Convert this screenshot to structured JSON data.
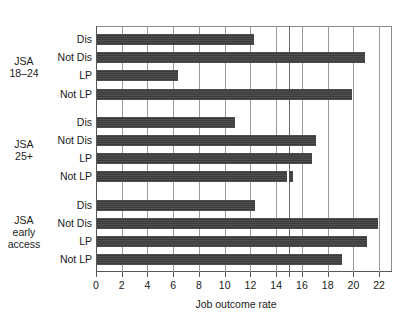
{
  "chart_data": {
    "type": "bar",
    "orientation": "horizontal",
    "title": "",
    "xlabel": "Job outcome rate",
    "ylabel": "",
    "xlim": [
      0,
      23
    ],
    "ylim": null,
    "grid": true,
    "legend": null,
    "xticks": [
      0,
      2,
      4,
      6,
      8,
      10,
      12,
      14,
      16,
      18,
      20,
      22
    ],
    "xtick_labels": [
      "0",
      "2",
      "4",
      "6",
      "8",
      "10",
      "12",
      "14",
      "16",
      "18",
      "20",
      "22"
    ],
    "extra_reference_line": 15,
    "bar_color": "#3b3b3b",
    "groups": [
      {
        "name": "JSA 18-24",
        "label_lines": [
          "JSA",
          "18–24"
        ],
        "categories": [
          "Dis",
          "Not Dis",
          "LP",
          "Not LP"
        ],
        "values": [
          12.2,
          20.8,
          6.3,
          19.8
        ]
      },
      {
        "name": "JSA 25+",
        "label_lines": [
          "JSA",
          "25+"
        ],
        "categories": [
          "Dis",
          "Not Dis",
          "LP",
          "Not LP"
        ],
        "values": [
          10.7,
          17.0,
          16.7,
          15.2
        ]
      },
      {
        "name": "JSA early access",
        "label_lines": [
          "JSA",
          "early",
          "access"
        ],
        "categories": [
          "Dis",
          "Not Dis",
          "LP",
          "Not LP"
        ],
        "values": [
          12.3,
          21.8,
          21.0,
          19.0
        ]
      }
    ]
  }
}
